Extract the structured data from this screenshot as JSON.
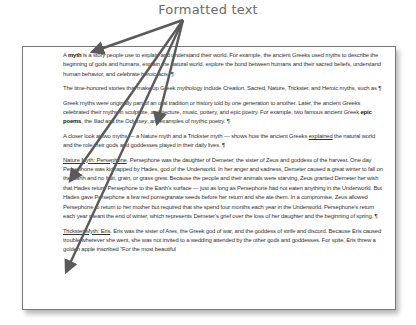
{
  "callout": {
    "label": "Formatted text"
  },
  "document": {
    "paragraphs": [
      {
        "segments": [
          {
            "text": "A ",
            "style": ""
          },
          {
            "text": "myth",
            "style": "b"
          },
          {
            "text": " is a story people use to explain and understand their world. For example, the ancient Greeks used myths to describe the beginning of gods and humans, explain the natural world, explore the bond between humans and their sacred beliefs, understand human behavior, and celebrate heroic acts. ",
            "style": ""
          },
          {
            "text": "¶",
            "style": "pilcrow"
          }
        ]
      },
      {
        "segments": [
          {
            "text": "The time-honored stories that make up Greek mythology include Creation, Sacred, Nature, Trickster, and Heroic myths, such as ",
            "style": ""
          },
          {
            "text": "¶",
            "style": "pilcrow"
          }
        ]
      },
      {
        "segments": [
          {
            "text": "Greek myths were originally part of an oral tradition or history told by one generation to another. Later, the ancient Greeks celebrated their myths in sculpture, architecture, music, pottery, and epic poetry. For example, two famous ancient Greek ",
            "style": ""
          },
          {
            "text": "epic poems",
            "style": "b"
          },
          {
            "text": ", the ",
            "style": ""
          },
          {
            "text": "Iliad",
            "style": "i"
          },
          {
            "text": " and the ",
            "style": ""
          },
          {
            "text": "Odyssey",
            "style": "i"
          },
          {
            "text": ", are examples of mythic poetry. ",
            "style": ""
          },
          {
            "text": "¶",
            "style": "pilcrow"
          }
        ]
      },
      {
        "segments": [
          {
            "text": "A closer look at two myths — a Nature myth and a Trickster myth — shows how the ancient Greeks ",
            "style": ""
          },
          {
            "text": "explained",
            "style": "u"
          },
          {
            "text": " the natural world and the role their gods and goddesses played in their daily lives. ",
            "style": ""
          },
          {
            "text": "¶",
            "style": "pilcrow"
          }
        ]
      },
      {
        "segments": [
          {
            "text": "Nature Myth: Persephone",
            "style": "u"
          },
          {
            "text": ". Persephone was the daughter of Demeter, the sister of Zeus and goddess of the harvest. One day Persephone was kidnapped by Hades, god of the Underworld. In her anger and sadness, Demeter caused a great winter to fall on the Earth and no fruit, grain, or grass grew. Because the people and their animals were starving, Zeus granted Demeter her wish that Hades return Persephone to the Earth's surface — just as long as Persephone had not eaten anything in the Underworld. But Hades gave Persephone a few red pomegranate seeds before her return and she ate them. In a compromise, Zeus allowed Persephone to return to her mother but required that she spend four months each year in the Underworld. Persephone's return each year meant the end of winter, which represents Demeter's grief over the loss of her daughter and the beginning of spring. ",
            "style": ""
          },
          {
            "text": "¶",
            "style": "pilcrow"
          }
        ]
      },
      {
        "segments": [
          {
            "text": "Trickster Myth: Eris",
            "style": "u"
          },
          {
            "text": ". Eris was the sister of Ares, the Greek god of war, and the goddess of strife and discord. Because Eris caused trouble wherever she went, she was not invited to a wedding attended by the other gods and goddesses. For spite, Eris threw a golden apple inscribed \"For the most beautiful",
            "style": ""
          }
        ]
      }
    ]
  },
  "arrows": {
    "color": "#5a5a5a",
    "origin": [
      183,
      20
    ],
    "targets": [
      {
        "name": "myth-bold",
        "to": [
          92,
          52
        ]
      },
      {
        "name": "explained-underline",
        "to": [
          70,
          181
        ]
      },
      {
        "name": "persephone-heading",
        "to": [
          66,
          272
        ]
      },
      {
        "name": "epic-poems-bold",
        "to": [
          157,
          124
        ]
      }
    ]
  }
}
